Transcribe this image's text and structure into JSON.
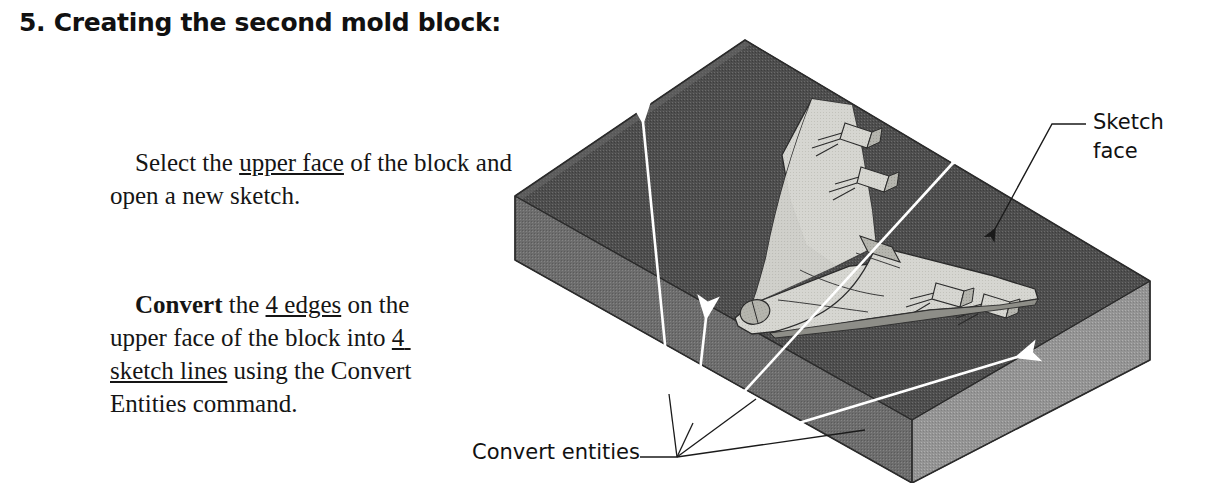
{
  "heading": {
    "text": "5. Creating the second mold block:"
  },
  "paragraphs": [
    {
      "id": "para1",
      "segments": [
        {
          "text": "Select the ",
          "style": "normal"
        },
        {
          "text": "upper face",
          "style": "underline"
        },
        {
          "text": " of the block and open a new sketch.",
          "style": "normal"
        }
      ],
      "plain": "Select the upper face of the block and open a new sketch."
    },
    {
      "id": "para2",
      "segments": [
        {
          "text": "Convert",
          "style": "bold"
        },
        {
          "text": " the ",
          "style": "normal"
        },
        {
          "text": "4 edges",
          "style": "underline"
        },
        {
          "text": " on the upper face of the block into ",
          "style": "normal"
        },
        {
          "text": "4 sketch lines",
          "style": "underline"
        },
        {
          "text": " using the Convert Entities command.",
          "style": "normal"
        }
      ],
      "plain": "Convert the 4 edges on the upper face of the block into 4 sketch lines using the Convert Entities command."
    }
  ],
  "callouts": {
    "sketch_face": {
      "line1": "Sketch",
      "line2": "face",
      "full": "Sketch face",
      "leader_color": "#1a1a1a",
      "arrow_color": "#1a1a1a"
    },
    "convert_entities": {
      "text": "Convert entities",
      "leader_color": "#1a1a1a",
      "arrow_color": "#ffffff",
      "arrow_count": 4
    }
  },
  "figure": {
    "colors": {
      "top_face": "#555555",
      "front_left_face": "#6e6e6e",
      "right_face": "#949494",
      "model_light": "#d9d9d4",
      "model_mid": "#bfbfb9",
      "model_shadow": "#8e8e88",
      "outline": "#1a1a1a",
      "highlight": "#ffffff",
      "background": "#ffffff"
    }
  }
}
